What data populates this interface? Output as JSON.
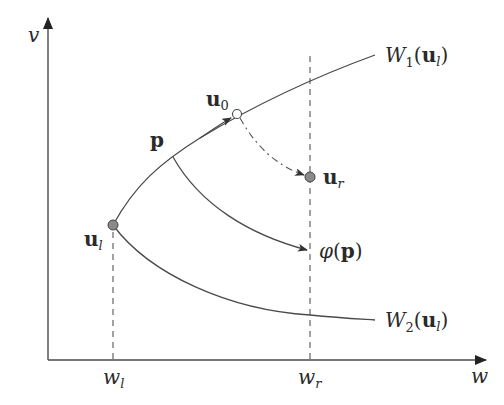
{
  "diagram": {
    "type": "phase-plane wave curves",
    "axes": {
      "x_label": "w",
      "y_label": "v"
    },
    "curves": [
      {
        "id": "W1",
        "label_main": "W",
        "label_sub": "1",
        "label_arg": "u",
        "label_arg_sub": "l"
      },
      {
        "id": "W2",
        "label_main": "W",
        "label_sub": "2",
        "label_arg": "u",
        "label_arg_sub": "l"
      }
    ],
    "points": {
      "ul": {
        "main": "u",
        "sub": "l",
        "style": "filled-gray"
      },
      "u0": {
        "main": "u",
        "sub": "0",
        "style": "open-circle"
      },
      "ur": {
        "main": "u",
        "sub": "r",
        "style": "filled-gray"
      },
      "p": {
        "main": "p"
      },
      "phi_p": {
        "func": "φ",
        "arg": "p"
      }
    },
    "ticks": {
      "wl": {
        "main": "w",
        "sub": "l"
      },
      "wr": {
        "main": "w",
        "sub": "r"
      }
    },
    "colors": {
      "line": "#4a4a4a",
      "point_fill": "#8a8a8a",
      "background": "#ffffff"
    }
  }
}
